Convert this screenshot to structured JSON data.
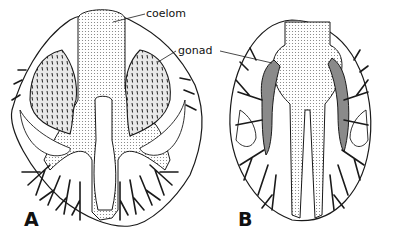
{
  "figure": {
    "panels": [
      {
        "id": "A",
        "label": "A"
      },
      {
        "id": "B",
        "label": "B"
      }
    ],
    "annotations": {
      "coelom": "coelom",
      "gonad": "gonad"
    },
    "colors": {
      "ink": "#1a1a1a",
      "stipple": "#9a9a9a",
      "gonad_fill_A": "#cfcfcf",
      "gonad_fill_B": "#8a8a8a",
      "background": "#ffffff"
    }
  }
}
